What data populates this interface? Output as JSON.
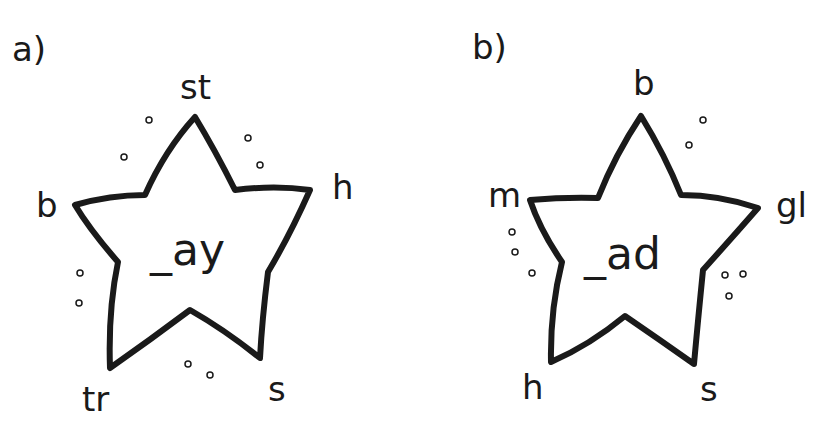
{
  "puzzles": [
    {
      "label": "a)",
      "center": "_ay",
      "onsets": {
        "top": "st",
        "right": "h",
        "bottom_right": "s",
        "bottom_left": "tr",
        "left": "b"
      }
    },
    {
      "label": "b)",
      "center": "_ad",
      "onsets": {
        "top": "b",
        "right": "gl",
        "bottom_right": "s",
        "bottom_left": "h",
        "left": "m"
      }
    }
  ]
}
